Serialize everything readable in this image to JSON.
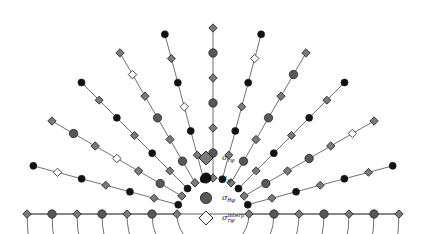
{
  "figure": {
    "type": "polar-annulus-mesh",
    "geometry": {
      "center_x": 213,
      "center_y": 214,
      "inner_radius": 36,
      "outer_radius": 186,
      "start_angle_deg": 180,
      "end_angle_deg": 360,
      "radial_levels": 7,
      "angular_divisions": 12,
      "arc_count": 7,
      "spoke_count": 13
    },
    "colors": {
      "grid_line": "#4d4d4d",
      "marker_gray": "#7a7a7a",
      "marker_dark_gray": "#585858",
      "marker_black": "#111111",
      "marker_white": "#ffffff",
      "marker_edge": "#1a1a1a",
      "background": "#ffffff"
    }
  },
  "legend": {
    "items": [
      {
        "marker": "diamond-gray",
        "shape": "diamond",
        "fill": "#7a7a7a",
        "symbol": "σ",
        "subscript": "rφ",
        "superscript": "",
        "name": "sigma-r-phi"
      },
      {
        "marker": "circle-black",
        "shape": "circle",
        "fill": "#111111",
        "symbol": "u",
        "subscript": "φ",
        "superscript": "",
        "name": "u-phi"
      },
      {
        "marker": "circle-gray",
        "shape": "circle",
        "fill": "#585858",
        "symbol": "σ",
        "subscript": "θφ",
        "superscript": "",
        "name": "sigma-theta-phi"
      },
      {
        "marker": "diamond-white",
        "shape": "diamond",
        "fill": "#ffffff",
        "symbol": "σ",
        "subscript": "rφ",
        "superscript": "interp",
        "name": "sigma-r-phi-interp"
      }
    ]
  },
  "chart_data": {
    "type": "scatter",
    "title": "",
    "xlabel": "",
    "ylabel": "",
    "grid": true,
    "legend_position": "center-bottom",
    "series": [
      {
        "name": "σ_rφ",
        "marker": "diamond-gray",
        "count": 49,
        "description": "Radial-azimuthal stress nodes on even radial levels at even angular positions"
      },
      {
        "name": "u_φ",
        "marker": "circle-black",
        "count": 42,
        "description": "Azimuthal displacement nodes on even radial levels at odd angular positions"
      },
      {
        "name": "σ_θφ",
        "marker": "circle-gray",
        "count": 36,
        "description": "Polar-azimuthal stress nodes on odd radial levels"
      },
      {
        "name": "σ_rφ^interp",
        "marker": "diamond-white",
        "count": 6,
        "description": "Interpolated radial-azimuthal stress nodes"
      }
    ],
    "radial_levels": [
      {
        "index": 0,
        "radius": 36,
        "node_type": "sigma-r-phi"
      },
      {
        "index": 1,
        "radius": 61,
        "node_type": "sigma-theta-phi"
      },
      {
        "index": 2,
        "radius": 86,
        "node_type": "sigma-r-phi"
      },
      {
        "index": 3,
        "radius": 111,
        "node_type": "sigma-theta-phi"
      },
      {
        "index": 4,
        "radius": 136,
        "node_type": "sigma-r-phi"
      },
      {
        "index": 5,
        "radius": 161,
        "node_type": "sigma-theta-phi"
      },
      {
        "index": 6,
        "radius": 186,
        "node_type": "sigma-r-phi"
      }
    ],
    "interp_nodes": [
      {
        "level": 3,
        "angle_index": 2
      },
      {
        "level": 3,
        "angle_index": 5
      },
      {
        "level": 5,
        "angle_index": 1
      },
      {
        "level": 5,
        "angle_index": 4
      },
      {
        "level": 5,
        "angle_index": 7
      },
      {
        "level": 5,
        "angle_index": 10
      }
    ]
  }
}
